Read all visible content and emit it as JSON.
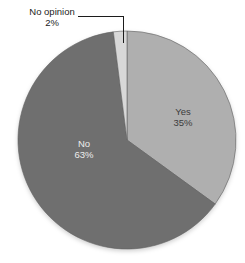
{
  "chart_data": {
    "type": "pie",
    "title": "",
    "direction": "clockwise",
    "start_angle_deg": 0,
    "total": 100,
    "slices": [
      {
        "label": "Yes",
        "value": 35,
        "pct_label": "35%",
        "color": "#afafaf",
        "text_color": "#3c3c3c",
        "label_position": "inside"
      },
      {
        "label": "No",
        "value": 63,
        "pct_label": "63%",
        "color": "#6f6f6f",
        "text_color": "#ededed",
        "label_position": "inside"
      },
      {
        "label": "No opinion",
        "value": 2,
        "pct_label": "2%",
        "color": "#d8d8d8",
        "text_color": "#1c1c1c",
        "label_position": "callout"
      }
    ],
    "outline_color": "#616161",
    "background_color": "#ffffff"
  }
}
